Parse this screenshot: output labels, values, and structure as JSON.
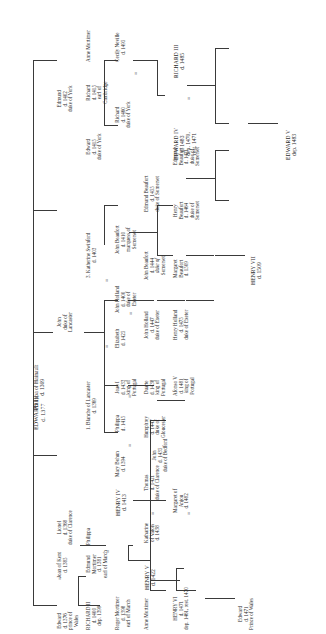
{
  "diagram": {
    "type": "family-tree",
    "orientation": "rotated-90-ccw",
    "symbols": {
      "marriage": "="
    },
    "ink_color": "#2b2b2b",
    "rule_color": "#3a3a3a"
  },
  "people": {
    "edward3": {
      "name": "EDWARD III",
      "l2": "d. 1377"
    },
    "philippa_h": {
      "name": "Philippa of Hainault",
      "l2": "d. 1369"
    },
    "edward_bp": {
      "name": "Edward",
      "l2": "d. 1376",
      "l3": "prince of",
      "l4": "Wales"
    },
    "joan_kent": {
      "name": "Joan of Kent",
      "l2": "d. 1385"
    },
    "lionel": {
      "name": "Lionel",
      "l2": "d. 1368",
      "l3": "duke of Clarence"
    },
    "john_gaunt": {
      "name": "John",
      "l2": "duke of",
      "l3": "Lancaster"
    },
    "edmund_york": {
      "name": "Edmund",
      "l2": "d. 1402",
      "l3": "duke of York"
    },
    "richard2": {
      "name": "RICHARD II",
      "l2": "d. 1400",
      "l3": "dep. 1399"
    },
    "edmund_mort": {
      "name": "Edmund",
      "l2": "Mortimer",
      "l3": "d. 1381",
      "l4": "earl of March"
    },
    "philippa_m": {
      "name": "Philippa"
    },
    "blanche": {
      "name": "1. Blanche of Lancaster",
      "l2": "d. 1369"
    },
    "katherine_s": {
      "name": "3. Katherine Swinford",
      "l2": "d. 1403"
    },
    "edward_york": {
      "name": "Edward",
      "l2": "d. 1415",
      "l3": "duke of York"
    },
    "richard_camb": {
      "name": "Richard",
      "l2": "d. 1415",
      "l3": "earl of",
      "l4": "Cambridge"
    },
    "anne_mort_1": {
      "name": "Anne Mortimer"
    },
    "roger_mort": {
      "name": "Roger Mortimer",
      "l2": "d. 1398",
      "l3": "earl of March"
    },
    "henry4": {
      "name": "HENRY IV",
      "l2": "d. 1413"
    },
    "mary_bohun": {
      "name": "Mary Bohun",
      "l2": "d. 1394"
    },
    "philippa_p": {
      "name": "Philippa",
      "l2": "d. 1415"
    },
    "joao1": {
      "name": "Joao I",
      "l2": "d. 1433",
      "l3": "king of",
      "l4": "Portugal"
    },
    "elizabeth": {
      "name": "Elizabeth",
      "l2": "d. 1425"
    },
    "john_holland": {
      "name": "John Holland",
      "l2": "d. 1400",
      "l3": "duke of",
      "l4": "Exeter"
    },
    "john_beau_m": {
      "name": "John Beaufort",
      "l2": "d. 1410",
      "l3": "marquess of",
      "l4": "Somerset"
    },
    "richard_york": {
      "name": "Richard",
      "l2": "d. 1460",
      "l3": "duke of York"
    },
    "cecily": {
      "name": "Cecily Neville",
      "l2": "d. 1495"
    },
    "anne_mort_2": {
      "name": "Anne Mortimer"
    },
    "henry5": {
      "name": "HENRY V",
      "l2": "d. 1422"
    },
    "katharine_v": {
      "name": "Katharine",
      "l2": "of Valois",
      "l3": "d. 1438"
    },
    "thomas_clar": {
      "name": "Thomas",
      "l2": "d. 1421",
      "l3": "duke of Clarence"
    },
    "john_bedford": {
      "name": "John",
      "l2": "d. 1435",
      "l3": "duke of Bedford"
    },
    "humphrey": {
      "name": "Humphrey",
      "l2": "d. 1447",
      "l3": "duke of",
      "l4": "Gloucester"
    },
    "duarte": {
      "name": "Duarte",
      "l2": "d. 1438",
      "l3": "king of",
      "l4": "Portugal"
    },
    "john_holl_ex": {
      "name": "John Holland",
      "l2": "d. 1447",
      "l3": "duke of Exeter"
    },
    "john_beau_d": {
      "name": "John Beaufort",
      "l2": "d. 1444",
      "l3": "duke of",
      "l4": "Somerset"
    },
    "edmund_beau": {
      "name": "Edmund Beaufort",
      "l2": "d. 1455",
      "l3": "duke of Somerset"
    },
    "edward4": {
      "name": "EDWARD IV",
      "l2": "d. 1483",
      "l3": "dep. 1470,",
      "l4": "rest. 1471"
    },
    "richard3": {
      "name": "RICHARD III",
      "l2": "d. 1485"
    },
    "henry6": {
      "name": "HENRY VI",
      "l2": "d. 1471",
      "l3": "dep. 1461, rest. 1470"
    },
    "margaret_anj": {
      "name": "Margaret of",
      "l2": "Anjou",
      "l3": "d. 1482"
    },
    "afonso5": {
      "name": "Afonso V",
      "l2": "d. 1481",
      "l3": "king of",
      "l4": "Portugal"
    },
    "henry_holl": {
      "name": "Henry Holland",
      "l2": "d. 1475",
      "l3": "duke of Exeter"
    },
    "margaret_beau": {
      "name": "Margaret",
      "l2": "Beaufort",
      "l3": "d. 1509"
    },
    "henry_beau": {
      "name": "Henry",
      "l2": "Beaufort",
      "l3": "d. 1464",
      "l4": "duke of",
      "l5": "Somerset"
    },
    "edmund_beau2": {
      "name": "Edmund",
      "l2": "Beaufort",
      "l3": "d. 1471",
      "l4": "duke of",
      "l5": "Somerset"
    },
    "edward5": {
      "name": "EDWARD V",
      "l2": "dep. 1483"
    },
    "edward_pw": {
      "name": "Edward",
      "l2": "d. 1471",
      "l3": "Prince of Wales"
    },
    "henry7": {
      "name": "HENRY VII",
      "l2": "d. 1509"
    }
  }
}
